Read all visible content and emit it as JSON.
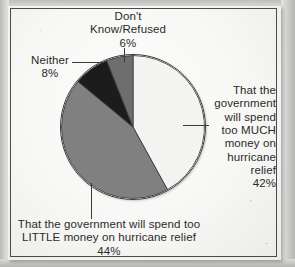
{
  "chart_data": {
    "type": "pie",
    "title": "",
    "categories": [
      "That the government will spend too MUCH money on hurricane relief",
      "That the government will spend too LITTLE money on hurricane relief",
      "Neither",
      "Don't Know/Refused"
    ],
    "values": [
      42,
      44,
      8,
      6
    ],
    "value_suffix": "%",
    "colors": [
      "#f3f3f1",
      "#808080",
      "#1c1c1c",
      "#6e6e6e"
    ],
    "start_angle_deg": 0,
    "direction": "clockwise",
    "legend": "none",
    "grid": false,
    "labels_position": "callout",
    "annotations": [
      "Don't Know/Refused 6%",
      "Neither 8%",
      "That the government will spend too MUCH money on hurricane relief 42%",
      "That the government will spend too LITTLE money on hurricane relief 44%"
    ]
  },
  "labels": {
    "dont_know": {
      "line1": "Don't",
      "line2": "Know/Refused",
      "value": "6%"
    },
    "neither": {
      "line1": "Neither",
      "value": "8%"
    },
    "much": {
      "line1": "That the",
      "line2": "government",
      "line3": "will spend",
      "line4": "too MUCH",
      "line5": "money on",
      "line6": "hurricane",
      "line7": "relief",
      "value": "42%"
    },
    "little": {
      "line1": "That the government will spend too",
      "line2": "LITTLE money on hurricane relief",
      "value": "44%"
    }
  },
  "colors": {
    "slice_much": "#f3f3f1",
    "slice_little": "#808080",
    "slice_neither": "#1c1c1c",
    "slice_dont_know": "#6e6e6e",
    "outline": "#3c3c3c",
    "frame": "#4a4a4a",
    "text": "#2b2b2b",
    "paper": "#f7f7f5"
  }
}
